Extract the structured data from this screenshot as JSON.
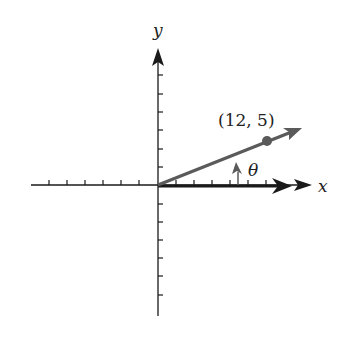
{
  "diagram": {
    "title": "",
    "axes": {
      "x_label": "x",
      "y_label": "y",
      "origin": {
        "x": 158,
        "y": 185
      },
      "tick_spacing_px": 18,
      "x_ticks_negative": 6,
      "x_ticks_positive": 6,
      "y_ticks_positive": 6,
      "y_ticks_negative": 6
    },
    "point": {
      "label": "(12, 5)",
      "coords": [
        12,
        5
      ]
    },
    "angle": {
      "label": "θ"
    },
    "colors": {
      "axis": "#1a1a1a",
      "terminal_ray": "#5a5a5a",
      "initial_ray": "#1a1a1a"
    }
  }
}
